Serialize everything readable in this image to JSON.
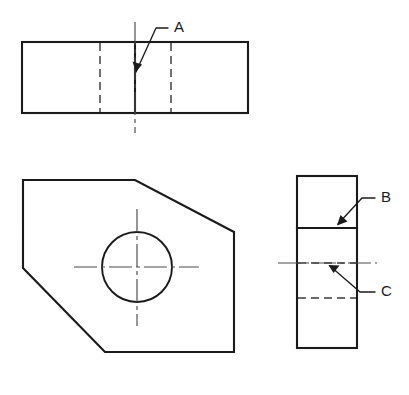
{
  "drawing": {
    "title": "Orthographic Projection - Three View Engineering Drawing",
    "background_color": "#ffffff",
    "line_color": "#1a1a1a",
    "hidden_line_color": "#3a3a3a",
    "center_line_color": "#4a4a4a",
    "views": {
      "top": {
        "name": "top-view",
        "rect": {
          "x": 22,
          "y": 42,
          "width": 226,
          "height": 71
        },
        "solid_vertical_x": 135,
        "hidden_vertical_x": [
          100,
          171
        ],
        "center_vertical": {
          "x": 135,
          "y1": 22,
          "y2": 133
        }
      },
      "front": {
        "name": "front-view",
        "polygon": "23,180 135,180 234,232 234,352 105,352 23,268",
        "circle": {
          "cx": 137,
          "cy": 267,
          "r": 35
        },
        "center_horizontal": {
          "x1": 74,
          "x2": 199,
          "y": 267
        },
        "center_vertical": {
          "x": 137,
          "y1": 209,
          "y2": 326
        }
      },
      "side": {
        "name": "right-side-view",
        "rect": {
          "x": 297,
          "y": 176,
          "width": 60,
          "height": 172
        },
        "solid_horizontal_y": 228,
        "hidden_horizontal_y": [
          263,
          298
        ],
        "center_horizontal": {
          "x1": 278,
          "x2": 377,
          "y": 263
        }
      }
    },
    "labels": [
      {
        "id": "label-a",
        "text": "A",
        "text_x": 174,
        "text_y": 28,
        "leader_path": "M 168 28 L 156 28 L 136 72",
        "arrow_points": "136,72 133,62 142,64"
      },
      {
        "id": "label-b",
        "text": "B",
        "text_x": 381,
        "text_y": 198,
        "leader_path": "M 375 198 L 362 198 L 338 224",
        "arrow_points": "338,224 341,214 347,221"
      },
      {
        "id": "label-c",
        "text": "C",
        "text_x": 381,
        "text_y": 292,
        "leader_path": "M 375 292 L 360 292 L 330 266",
        "arrow_points": "330,266 340,266 334,273"
      }
    ]
  }
}
